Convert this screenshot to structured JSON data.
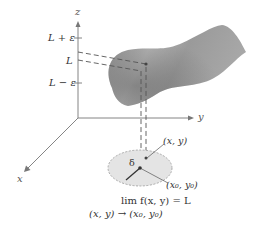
{
  "figure": {
    "type": "epsilon-delta limit illustration",
    "axes": {
      "x_label": "x",
      "y_label": "y",
      "z_label": "z"
    },
    "z_ticks": [
      {
        "label": "L + ε",
        "level": "upper"
      },
      {
        "label": "L",
        "level": "limit"
      },
      {
        "label": "L − ε",
        "level": "lower"
      }
    ],
    "disk": {
      "radius_label": "δ",
      "center_label": "(x₀, y₀)",
      "point_label": "(x, y)"
    },
    "caption": {
      "line1": "lim f(x, y) = L",
      "line2": "(x, y) → (x₀, y₀)"
    },
    "colors": {
      "axes": "#777777",
      "surface_dark": "#6e6e6e",
      "surface_light": "#c8c8c8",
      "disk_fill": "#e4e4e4",
      "dash": "#555555",
      "text": "#333333"
    }
  }
}
